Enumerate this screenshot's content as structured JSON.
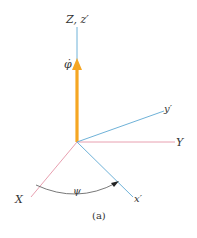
{
  "figure": {
    "caption": "(a)",
    "labels": {
      "z_axis": "Z, z′",
      "phi_dot": "φ̇",
      "y_prime": "y′",
      "y_axis": "Y",
      "x_axis": "X",
      "x_prime": "x′",
      "psi": "ψ"
    },
    "colors": {
      "fixed_axes": "#e8a0b0",
      "rotated_axes": "#6fb2d8",
      "angular_velocity": "#f5a623",
      "arc": "#555555"
    }
  }
}
